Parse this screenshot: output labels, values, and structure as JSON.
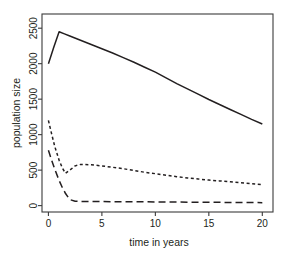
{
  "chart_data": {
    "type": "line",
    "title": "",
    "xlabel": "time in years",
    "ylabel": "population size",
    "xlim": [
      -0.6,
      21.0
    ],
    "ylim": [
      -90,
      2700
    ],
    "xticks": [
      0,
      5,
      10,
      15,
      20
    ],
    "xtick_labels": [
      "0",
      "5",
      "10",
      "15",
      "20"
    ],
    "yticks": [
      0,
      500,
      1000,
      1500,
      2000,
      2500
    ],
    "ytick_labels": [
      "0",
      "500",
      "1000",
      "1500",
      "2000",
      "2500"
    ],
    "grid": false,
    "legend": "none",
    "frame": true,
    "series": [
      {
        "name": "solid-curve",
        "style": "solid",
        "color": "#231f20",
        "x": [
          0,
          0.5,
          1.0,
          1.5,
          2.0,
          3.0,
          4.0,
          5.0,
          6.0,
          7.0,
          8.0,
          9.0,
          10.0,
          11.0,
          12.0,
          13.0,
          14.0,
          15.0,
          16.0,
          17.0,
          18.0,
          19.0,
          20.0
        ],
        "y": [
          2000,
          2230,
          2450,
          2420,
          2390,
          2330,
          2270,
          2210,
          2150,
          2085,
          2020,
          1950,
          1880,
          1800,
          1720,
          1645,
          1570,
          1495,
          1425,
          1355,
          1285,
          1215,
          1150
        ]
      },
      {
        "name": "short-dash-curve",
        "style": "short-dash",
        "color": "#231f20",
        "x": [
          0,
          0.3,
          0.6,
          1.0,
          1.3,
          1.6,
          2.0,
          2.5,
          3.0,
          4.0,
          5.0,
          6.0,
          7.0,
          8.0,
          9.0,
          10.0,
          11.0,
          12.0,
          13.0,
          14.0,
          15.0,
          16.0,
          17.0,
          18.0,
          19.0,
          20.0
        ],
        "y": [
          1200,
          1010,
          830,
          640,
          530,
          455,
          500,
          560,
          580,
          575,
          560,
          540,
          520,
          495,
          470,
          450,
          428,
          408,
          390,
          375,
          360,
          348,
          335,
          322,
          308,
          295
        ]
      },
      {
        "name": "long-dash-curve",
        "style": "long-dash",
        "color": "#231f20",
        "x": [
          0,
          0.3,
          0.6,
          1.0,
          1.3,
          1.6,
          2.0,
          2.5,
          3.0,
          4.0,
          5.0,
          6.0,
          8.0,
          10.0,
          12.0,
          14.0,
          16.0,
          18.0,
          20.0
        ],
        "y": [
          780,
          640,
          510,
          355,
          255,
          170,
          85,
          62,
          58,
          58,
          57,
          56,
          54,
          52,
          50,
          48,
          46,
          44,
          42
        ]
      }
    ]
  }
}
